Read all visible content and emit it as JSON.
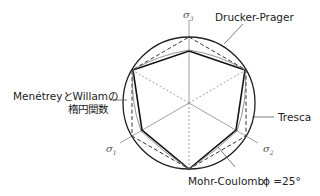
{
  "labels": {
    "drucker_prager": "Drucker-Prager",
    "menetrey_line1": "MenétreyとWillamの",
    "menetrey_line2": "楕円関数",
    "tresca": "Tresca",
    "mohr_coulomb": "Mohr-Coulomb",
    "phi": "ϕ =25°"
  },
  "axes": {
    "s1": "σ",
    "s1_sub": "1",
    "s2": "σ",
    "s2_sub": "2",
    "s3": "σ",
    "s3_sub": "3"
  }
}
